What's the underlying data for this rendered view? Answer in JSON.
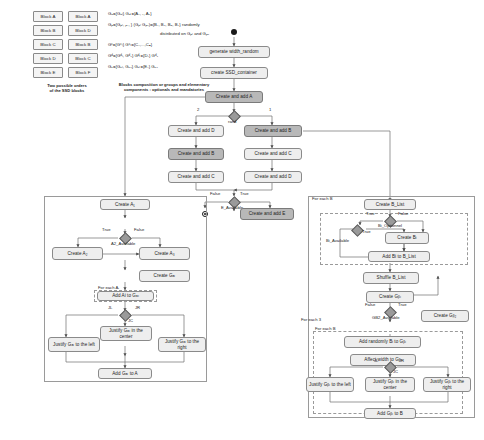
{
  "legend": {
    "order_columns": [
      {
        "items": [
          "Block A",
          "Block B",
          "Block C",
          "Block D",
          "Block E"
        ]
      },
      {
        "items": [
          "Block A",
          "Block D",
          "Block B",
          "Block C",
          "Block F"
        ]
      }
    ],
    "order_caption": "Two possible orders\nof the SSD blocks",
    "formulas": [
      "Gₐ={Gₐₗ}  Gₐₗ={A₁, ₁, A₂}",
      "Gᵦ={Gᵦₗ, ᵦ₁, } (Gᵦₗ Gᵦ₂)={B₁, B₂, B₃, B₄} randomly",
      "distributed on Gᵦₗ and Gᵦ₂",
      "Gᶜ={Gᶜₗ}  Gᶜₗ={C₁,...,Cₙ}",
      "Gᵈ={Gᵈₗ, Gᵈ₂}  Gᵈₗ={D₁}  Gᵈ₂",
      "Gₑ={Gₑₗ, Gₑ₂}  Gₑₗ={E₁}  Gₑ₂"
    ],
    "formula_caption": "Blocks composition or groups and elementary\ncomponents : optionals and mandatories"
  },
  "main": {
    "start_node": "start",
    "generate": "generate width_random",
    "create_container": "create SSD_container",
    "create_add_a": "Create and add A",
    "branch_left_label": "2",
    "branch_right_label": "1",
    "branch_center_label": "rand",
    "left_chain": [
      "Create and add D",
      "Create and add B",
      "Create and add C"
    ],
    "right_chain": [
      "Create and add B",
      "Create and add C",
      "Create and add D"
    ],
    "e_available": "E_Available",
    "e_false": "False",
    "e_true": "True",
    "create_add_e": "Create and add E",
    "end_node": "end"
  },
  "left_sub": {
    "create_a1": "Create A₁",
    "diamond": "A2_Available",
    "d_true": "True",
    "d_false": "False",
    "create_a2": "Create A₂",
    "create_a3": "Create A₃",
    "create_gal": "Create Gₐₗ",
    "for_each": "For each Aᵢ",
    "add_ai": "Add Ai to Gₐₗ",
    "jl": "JL",
    "jc": "JC",
    "jr": "JR",
    "justify_left": "Justify Gₐₗ to the left",
    "justify_center": "Justify Gₐₗ in the center",
    "justify_right": "Justify Gₐₗ to the right",
    "add_gal": "Add Gₐₗ to A"
  },
  "right_sub": {
    "create_blist": "Create B_List",
    "for_each_b_top": "For each B",
    "bi_optionnel": "Bi_Optionnel",
    "bi_available": "Bi_Available",
    "opt_true": "True",
    "opt_false": "False",
    "avail_true": "True",
    "create_bi": "Create Bᵢ",
    "add_bi": "Add Bi to B_List",
    "shuffle": "Shuffle B_List",
    "create_gbl": "Create Gᵦₗ",
    "gb2_diamond": "GB2_Available",
    "gb2_false": "False",
    "gb2_true": "True",
    "create_gb2": "Create Gᵦ₂",
    "for_each_3": "For each 3",
    "for_each_b": "For each B",
    "add_randomly": "Add randomly Bᵢ to Gᵦₗ",
    "affect_width": "Affect width to Gᵦₗ",
    "jl": "JL",
    "jc": "JC",
    "jr": "JR",
    "justify_left": "Justify Gᵦₗ to the left",
    "justify_center": "Justify Gᵦₗ in the center",
    "justify_right": "Justify Gᵦₗ to the right",
    "add_gbl": "Add Gᵦₗ to B"
  }
}
